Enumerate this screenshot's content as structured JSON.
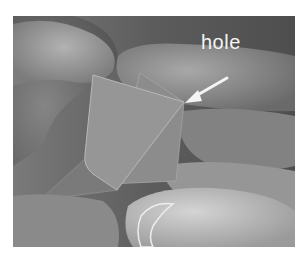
{
  "figure": {
    "annotation": {
      "label": "hole",
      "arrow": "pointing to the corner of the folded model"
    },
    "colors": {
      "background": "#ffffff",
      "annotation": "#f4f4f4"
    }
  }
}
